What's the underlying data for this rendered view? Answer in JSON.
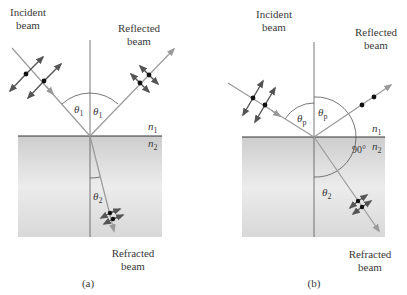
{
  "panels": [
    {
      "id": "a",
      "caption": "(a)",
      "incident_label": [
        "Incident",
        "beam"
      ],
      "reflected_label": [
        "Reflected",
        "beam"
      ],
      "refracted_label": [
        "Refracted",
        "beam"
      ],
      "angle_incident": "θ",
      "angle_incident_sub": "1",
      "angle_reflected": "θ",
      "angle_reflected_sub": "1",
      "angle_refracted": "θ",
      "angle_refracted_sub": "2",
      "medium_top": "n",
      "medium_top_sub": "1",
      "medium_bottom": "n",
      "medium_bottom_sub": "2",
      "polarization": {
        "incident": "unpolarized (parallel + perpendicular)",
        "reflected": "partially polarized",
        "refracted": "partially polarized"
      }
    },
    {
      "id": "b",
      "caption": "(b)",
      "incident_label": [
        "Incident",
        "beam"
      ],
      "reflected_label": [
        "Reflected",
        "beam"
      ],
      "refracted_label": [
        "Refracted",
        "beam"
      ],
      "angle_incident": "θ",
      "angle_incident_sub": "p",
      "angle_reflected": "θ",
      "angle_reflected_sub": "p",
      "angle_refracted": "θ",
      "angle_refracted_sub": "2",
      "right_angle_label": "90°",
      "medium_top": "n",
      "medium_top_sub": "1",
      "medium_bottom": "n",
      "medium_bottom_sub": "2",
      "polarization": {
        "incident": "unpolarized (parallel + perpendicular)",
        "reflected": "completely polarized (dots only)",
        "refracted": "partially polarized"
      }
    }
  ],
  "colors": {
    "ray": "#9a9a9a",
    "arrow": "#555555",
    "dot": "#111111",
    "medium2_top": "#cfcfcf",
    "medium2_bottom": "#e2e2e2",
    "interface": "#333333",
    "normal": "#555555"
  }
}
